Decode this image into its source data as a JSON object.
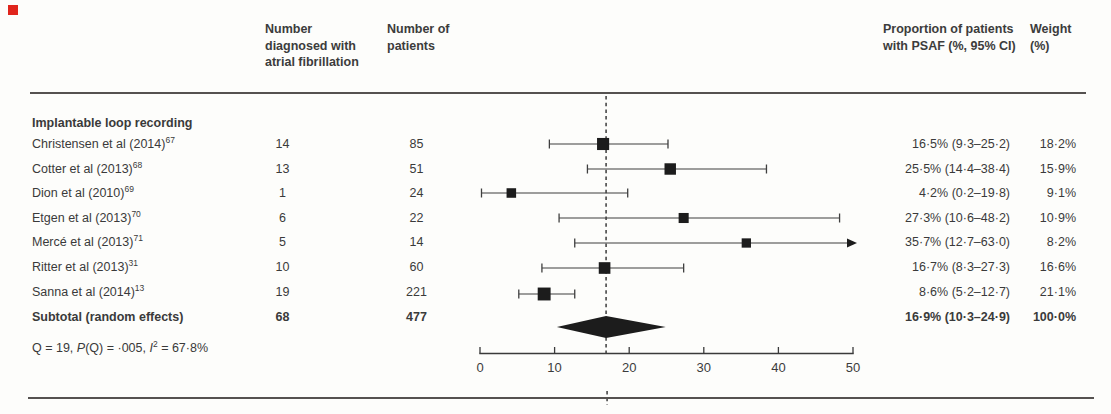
{
  "figure_marker_color": "#e0251c",
  "header": {
    "col_af": "Number diagnosed with atrial fibrillation",
    "col_n": "Number of patients",
    "col_psaf": "Proportion of patients with PSAF (%, 95% CI)",
    "col_weight": "Weight (%)"
  },
  "section_title": "Implantable loop recording",
  "rows": [
    {
      "label": "Christensen et al (2014)",
      "ref": "67",
      "af": "14",
      "n": "85",
      "psaf": "16·5% (9·3–25·2)",
      "weight": "18·2%"
    },
    {
      "label": "Cotter et al (2013)",
      "ref": "68",
      "af": "13",
      "n": "51",
      "psaf": "25·5% (14·4–38·4)",
      "weight": "15·9%"
    },
    {
      "label": "Dion et al (2010)",
      "ref": "69",
      "af": "1",
      "n": "24",
      "psaf": "4·2% (0·2–19·8)",
      "weight": "9·1%"
    },
    {
      "label": "Etgen et al (2013)",
      "ref": "70",
      "af": "6",
      "n": "22",
      "psaf": "27·3% (10·6–48·2)",
      "weight": "10·9%"
    },
    {
      "label": "Mercé et al (2013)",
      "ref": "71",
      "af": "5",
      "n": "14",
      "psaf": "35·7% (12·7–63·0)",
      "weight": "8·2%"
    },
    {
      "label": "Ritter et al (2013)",
      "ref": "31",
      "af": "10",
      "n": "60",
      "psaf": "16·7% (8·3–27·3)",
      "weight": "16·6%"
    },
    {
      "label": "Sanna et al (2014)",
      "ref": "13",
      "af": "19",
      "n": "221",
      "psaf": "8·6% (5·2–12·7)",
      "weight": "21·1%"
    }
  ],
  "subtotal": {
    "label": "Subtotal (random effects)",
    "af": "68",
    "n": "477",
    "psaf": "16·9% (10·3–24·9)",
    "weight": "100·0%"
  },
  "heterogeneity_parts": [
    {
      "t": "Q = 19, "
    },
    {
      "t": "P",
      "i": true
    },
    {
      "t": "(Q) = ·005, "
    },
    {
      "t": "I",
      "i": true
    },
    {
      "t": "2",
      "sup": true
    },
    {
      "t": " = 67·8%"
    }
  ],
  "chart_data": {
    "type": "forest",
    "title": "Implantable loop recording",
    "x_axis": {
      "min": 0,
      "max": 50,
      "ticks": [
        "0",
        "10",
        "20",
        "30",
        "40",
        "50"
      ]
    },
    "studies": [
      {
        "name": "Christensen et al (2014)",
        "estimate": 16.5,
        "ci_low": 9.3,
        "ci_high": 25.2,
        "weight_pct": 18.2
      },
      {
        "name": "Cotter et al (2013)",
        "estimate": 25.5,
        "ci_low": 14.4,
        "ci_high": 38.4,
        "weight_pct": 15.9
      },
      {
        "name": "Dion et al (2010)",
        "estimate": 4.2,
        "ci_low": 0.2,
        "ci_high": 19.8,
        "weight_pct": 9.1
      },
      {
        "name": "Etgen et al (2013)",
        "estimate": 27.3,
        "ci_low": 10.6,
        "ci_high": 48.2,
        "weight_pct": 10.9
      },
      {
        "name": "Mercé et al (2013)",
        "estimate": 35.7,
        "ci_low": 12.7,
        "ci_high": 63.0,
        "weight_pct": 8.2,
        "ci_high_offscale": true
      },
      {
        "name": "Ritter et al (2013)",
        "estimate": 16.7,
        "ci_low": 8.3,
        "ci_high": 27.3,
        "weight_pct": 16.6
      },
      {
        "name": "Sanna et al (2014)",
        "estimate": 8.6,
        "ci_low": 5.2,
        "ci_high": 12.7,
        "weight_pct": 21.1
      }
    ],
    "pooled": {
      "name": "Subtotal (random effects)",
      "estimate": 16.9,
      "ci_low": 10.3,
      "ci_high": 24.9,
      "weight_pct": 100.0
    },
    "reference_line": 16.9,
    "legend": "none",
    "grid": false
  }
}
